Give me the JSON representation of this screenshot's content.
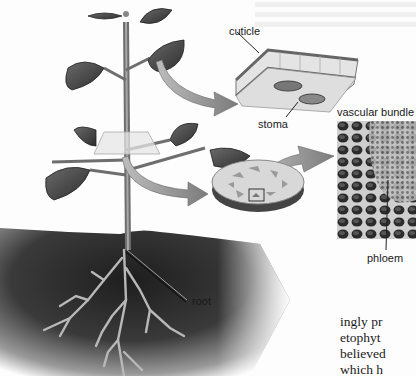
{
  "figure": {
    "type": "labeled botanical illustration",
    "palette": {
      "background": "#fdfdfd",
      "soil_dark": "#2a2a2a",
      "leaf": "#4a4a4a",
      "stem": "#7a7a7a",
      "arrow": "#9a9a9a",
      "label_text": "#1a1a1a"
    }
  },
  "labels": {
    "cuticle": "cuticle",
    "stoma": "stoma",
    "vascular_bundle": "vascular bundle",
    "phloem": "phloem",
    "root": "root"
  },
  "body_text": {
    "lines": [
      "ingly pr",
      "etophyt",
      "believed",
      "which h"
    ]
  }
}
